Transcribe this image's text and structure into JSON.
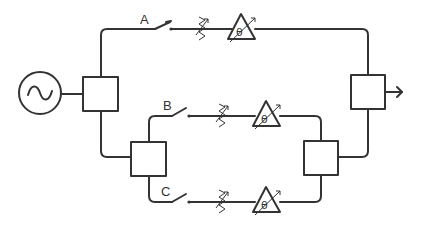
{
  "diagram": {
    "type": "RF phased-array / beam-switching schematic",
    "source": {
      "icon": "ac-source-icon",
      "symbol": "~"
    },
    "branches": [
      {
        "label": "A",
        "components": [
          "switch",
          "variable-attenuator",
          "phase-shifter"
        ],
        "phase_symbol": "θ"
      },
      {
        "label": "B",
        "components": [
          "switch",
          "variable-attenuator",
          "phase-shifter"
        ],
        "phase_symbol": "θ"
      },
      {
        "label": "C",
        "components": [
          "switch",
          "variable-attenuator",
          "phase-shifter"
        ],
        "phase_symbol": "θ"
      }
    ],
    "splitters": 2,
    "combiners": 2,
    "output": {
      "icon": "output-arrow-icon"
    },
    "colors": {
      "line": "#333333",
      "background": "#ffffff"
    }
  }
}
